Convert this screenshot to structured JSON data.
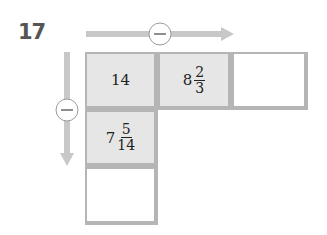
{
  "problem": {
    "number": "17",
    "horizontal_operation": {
      "symbol": "−",
      "direction": "right"
    },
    "vertical_operation": {
      "symbol": "−",
      "direction": "down"
    },
    "top_row": [
      {
        "type": "whole",
        "value": "14"
      },
      {
        "type": "mixed",
        "whole": "8",
        "numerator": "2",
        "denominator": "3"
      },
      {
        "type": "blank",
        "value": ""
      }
    ],
    "left_column": [
      {
        "type": "whole",
        "value": "14"
      },
      {
        "type": "mixed",
        "whole": "7",
        "numerator": "5",
        "denominator": "14"
      },
      {
        "type": "blank",
        "value": ""
      }
    ]
  },
  "colors": {
    "arrow": "#c8c8c8",
    "given_cell": "#e6e6e6",
    "border": "#b5b5b5"
  }
}
